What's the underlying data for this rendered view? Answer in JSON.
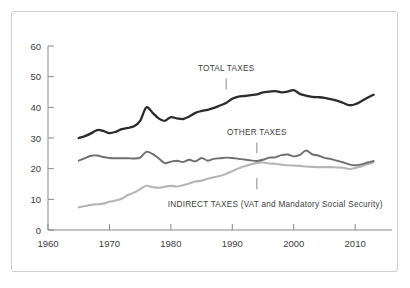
{
  "chart_data": {
    "type": "line",
    "title": "",
    "subtitle": "",
    "xlabel": "",
    "ylabel": "",
    "xlim": [
      1960,
      2016
    ],
    "ylim": [
      0,
      60
    ],
    "grid": false,
    "legend_position": "inline-annotations",
    "xticks": [
      1960,
      1970,
      1980,
      1990,
      2000,
      2010
    ],
    "xtick_labels": [
      "1960",
      "1970",
      "1980",
      "1990",
      "2000",
      "2010"
    ],
    "yticks": [
      0,
      10,
      20,
      30,
      40,
      50,
      60
    ],
    "ytick_labels": [
      "0",
      "10",
      "20",
      "30",
      "40",
      "50",
      "60"
    ],
    "series": [
      {
        "name": "TOTAL TAXES",
        "color": "#2b2b2b",
        "width": 2.3,
        "x": [
          1965,
          1966,
          1967,
          1968,
          1969,
          1970,
          1971,
          1972,
          1973,
          1974,
          1975,
          1976,
          1977,
          1978,
          1979,
          1980,
          1981,
          1982,
          1983,
          1984,
          1985,
          1986,
          1987,
          1988,
          1989,
          1990,
          1991,
          1992,
          1993,
          1994,
          1995,
          1996,
          1997,
          1998,
          1999,
          2000,
          2001,
          2002,
          2003,
          2004,
          2005,
          2006,
          2007,
          2008,
          2009,
          2010,
          2011,
          2012,
          2013
        ],
        "values": [
          30.0,
          30.6,
          31.5,
          32.6,
          32.3,
          31.6,
          32.0,
          32.9,
          33.3,
          33.8,
          35.6,
          40.0,
          38.3,
          36.4,
          35.6,
          36.8,
          36.4,
          36.2,
          37.0,
          38.2,
          38.8,
          39.2,
          39.8,
          40.6,
          41.4,
          42.8,
          43.5,
          43.7,
          44.0,
          44.2,
          44.9,
          45.1,
          45.3,
          44.9,
          45.1,
          45.6,
          44.4,
          43.8,
          43.4,
          43.3,
          43.1,
          42.7,
          42.2,
          41.5,
          40.7,
          41.0,
          42.0,
          43.1,
          44.1
        ]
      },
      {
        "name": "OTHER TAXES",
        "color": "#6e6e6e",
        "width": 1.9,
        "x": [
          1965,
          1966,
          1967,
          1968,
          1969,
          1970,
          1971,
          1972,
          1973,
          1974,
          1975,
          1976,
          1977,
          1978,
          1979,
          1980,
          1981,
          1982,
          1983,
          1984,
          1985,
          1986,
          1987,
          1988,
          1989,
          1990,
          1991,
          1992,
          1993,
          1994,
          1995,
          1996,
          1997,
          1998,
          1999,
          2000,
          2001,
          2002,
          2003,
          2004,
          2005,
          2006,
          2007,
          2008,
          2009,
          2010,
          2011,
          2012,
          2013
        ],
        "values": [
          22.6,
          23.4,
          24.2,
          24.3,
          23.8,
          23.5,
          23.4,
          23.4,
          23.4,
          23.3,
          23.6,
          25.5,
          24.8,
          23.4,
          21.8,
          22.3,
          22.6,
          22.2,
          22.9,
          22.4,
          23.5,
          22.6,
          23.2,
          23.4,
          23.6,
          23.5,
          23.2,
          23.0,
          22.7,
          22.5,
          22.9,
          23.6,
          23.7,
          24.4,
          24.6,
          24.0,
          24.5,
          25.9,
          24.7,
          24.3,
          23.5,
          23.2,
          22.6,
          22.1,
          21.4,
          21.1,
          21.4,
          22.0,
          22.5
        ]
      },
      {
        "name": "INDIRECT TAXES (VAT and Mandatory Social Security)",
        "color": "#b5b5b5",
        "width": 2.1,
        "x": [
          1965,
          1966,
          1967,
          1968,
          1969,
          1970,
          1971,
          1972,
          1973,
          1974,
          1975,
          1976,
          1977,
          1978,
          1979,
          1980,
          1981,
          1982,
          1983,
          1984,
          1985,
          1986,
          1987,
          1988,
          1989,
          1990,
          1991,
          1992,
          1993,
          1994,
          1995,
          1996,
          1997,
          1998,
          1999,
          2000,
          2001,
          2002,
          2003,
          2004,
          2005,
          2006,
          2007,
          2008,
          2009,
          2010,
          2011,
          2012,
          2013
        ],
        "values": [
          7.4,
          7.8,
          8.2,
          8.4,
          8.6,
          9.2,
          9.6,
          10.2,
          11.4,
          12.2,
          13.3,
          14.4,
          14.0,
          13.8,
          14.1,
          14.4,
          14.2,
          14.6,
          15.2,
          15.8,
          16.1,
          16.7,
          17.2,
          17.6,
          18.3,
          19.2,
          20.1,
          20.8,
          21.4,
          21.9,
          22.0,
          21.7,
          21.6,
          21.3,
          21.1,
          21.0,
          20.9,
          20.7,
          20.6,
          20.5,
          20.5,
          20.5,
          20.4,
          20.3,
          19.9,
          20.2,
          20.7,
          21.4,
          22.0
        ]
      }
    ],
    "annotations": [
      {
        "text": "TOTAL TAXES",
        "text_x": 1989,
        "text_y": 52.0,
        "leader_x": 1989,
        "leader_y_top": 49.5,
        "leader_y_bottom": 45.8
      },
      {
        "text": "OTHER TAXES",
        "text_x": 1994,
        "text_y": 31.0,
        "leader_x": 1994,
        "leader_y_top": 28.5,
        "leader_y_bottom": 25.0
      },
      {
        "text": "INDIRECT TAXES (VAT and Mandatory Social Security)",
        "text_x": 1994,
        "text_y": 7.6,
        "leader_x": 1994,
        "leader_y_top": 17.0,
        "leader_y_bottom": 13.3
      }
    ],
    "colors": {
      "total_taxes": "#2b2b2b",
      "other_taxes": "#6e6e6e",
      "indirect_taxes": "#b5b5b5",
      "axis": "#8a8a8a",
      "tick_label": "#3d3d3d",
      "frame": "#cfcfcf",
      "background": "#ffffff"
    }
  }
}
